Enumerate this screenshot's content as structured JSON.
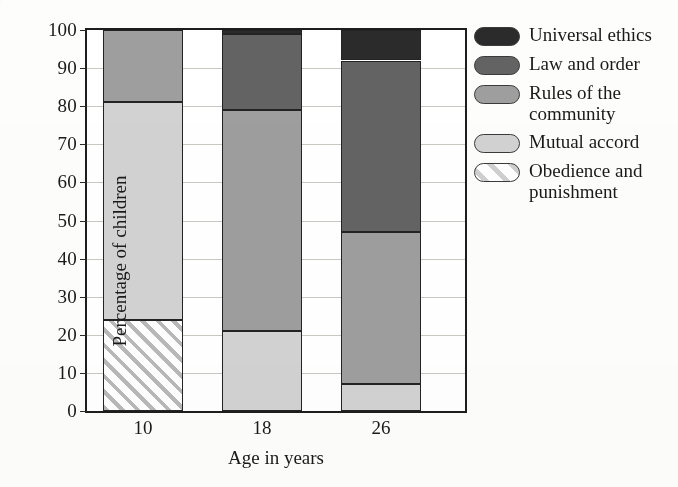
{
  "chart_data": {
    "type": "bar",
    "subtype": "stacked-100-percent",
    "title": "",
    "xlabel": "Age in years",
    "ylabel": "Percentage of children",
    "categories": [
      "10",
      "18",
      "26"
    ],
    "ylim": [
      0,
      100
    ],
    "yticks": [
      0,
      10,
      20,
      30,
      40,
      50,
      60,
      70,
      80,
      90,
      100
    ],
    "grid": true,
    "legend_position": "right",
    "series": [
      {
        "name": "Universal ethics",
        "color": "#2b2b2b",
        "swatch": "solid",
        "values": [
          0,
          1,
          8
        ]
      },
      {
        "name": "Law and order",
        "color": "#636363",
        "swatch": "solid",
        "values": [
          0,
          20,
          45
        ]
      },
      {
        "name": "Rules of the\ncommunity",
        "color": "#9e9e9e",
        "swatch": "solid",
        "values": [
          19,
          58,
          40
        ]
      },
      {
        "name": "Mutual accord",
        "color": "#d2d2d2",
        "swatch": "solid",
        "values": [
          57,
          21,
          7
        ]
      },
      {
        "name": "Obedience and\npunishment",
        "color": "#ffffff",
        "swatch": "hatched",
        "values": [
          24,
          0,
          0
        ]
      }
    ],
    "stack_boundaries": {
      "10": [
        0,
        24,
        81,
        100,
        100,
        100
      ],
      "18": [
        0,
        0,
        21,
        79,
        99,
        100
      ],
      "26": [
        0,
        0,
        7,
        47,
        92,
        100
      ]
    }
  },
  "axes": {
    "y_tick_labels": [
      "100",
      "90",
      "80",
      "70",
      "60",
      "50",
      "40",
      "30",
      "20",
      "10",
      "0"
    ],
    "x_tick_labels": [
      "10",
      "18",
      "26"
    ],
    "x_title": "Age in years",
    "y_title": "Percentage of children"
  },
  "legend": {
    "items": [
      {
        "label": "Universal ethics",
        "swatch_name": "swatch-universal-ethics"
      },
      {
        "label": "Law and order",
        "swatch_name": "swatch-law-and-order"
      },
      {
        "label": "Rules of the\ncommunity",
        "swatch_name": "swatch-rules-of-the-community"
      },
      {
        "label": "Mutual accord",
        "swatch_name": "swatch-mutual-accord"
      },
      {
        "label": "Obedience and\npunishment",
        "swatch_name": "swatch-obedience-and-punishment"
      }
    ]
  },
  "colors": {
    "universal_ethics": "#2b2b2b",
    "law_and_order": "#636363",
    "rules_of_the_community": "#9e9e9e",
    "mutual_accord": "#d2d2d2",
    "obedience_and_punishment": "#ffffff",
    "outline": "#232323",
    "gridline": "#c9c9c4",
    "background": "#fdfdfb"
  }
}
